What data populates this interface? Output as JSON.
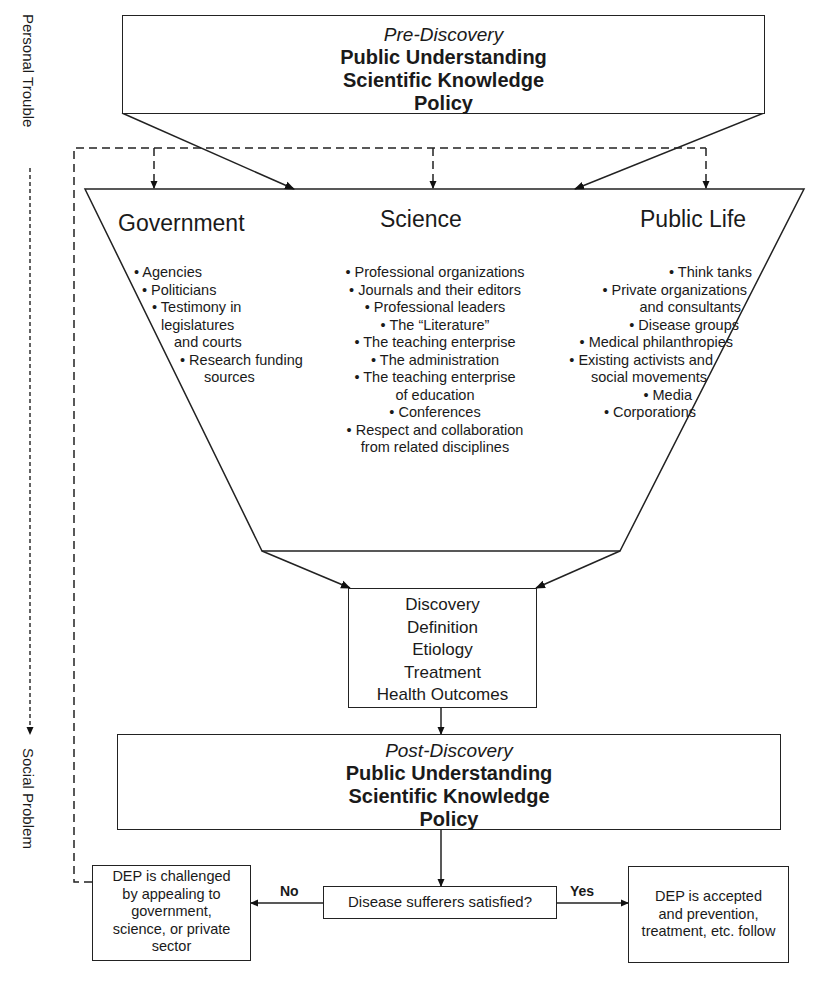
{
  "side_axis": {
    "top_label": "Personal Trouble",
    "bottom_label": "Social Problem"
  },
  "pre_discovery": {
    "title": "Pre-Discovery",
    "lines": [
      "Public Understanding",
      "Scientific Knowledge",
      "Policy"
    ]
  },
  "funnel": {
    "columns": [
      {
        "heading": "Government",
        "items": [
          "• Agencies",
          "• Politicians",
          "• Testimony in",
          "legislatures",
          "and courts",
          "• Research funding",
          "sources"
        ]
      },
      {
        "heading": "Science",
        "items": [
          "• Professional organizations",
          "• Journals and their editors",
          "• Professional leaders",
          "• The “Literature”",
          "• The teaching enterprise",
          "• The administration",
          "• The teaching enterprise",
          "of education",
          "• Conferences",
          "• Respect and collaboration",
          "from related disciplines"
        ]
      },
      {
        "heading": "Public Life",
        "items": [
          "• Think tanks",
          "• Private organizations",
          "and consultants",
          "• Disease groups",
          "• Medical philanthropies",
          "• Existing activists and",
          "social movements",
          "• Media",
          "• Corporations"
        ]
      }
    ]
  },
  "discovery_box": {
    "items": [
      "Discovery",
      "Definition",
      "Etiology",
      "Treatment",
      "Health Outcomes"
    ]
  },
  "post_discovery": {
    "title": "Post-Discovery",
    "lines": [
      "Public Understanding",
      "Scientific Knowledge",
      "Policy"
    ]
  },
  "decision": {
    "question": "Disease sufferers satisfied?",
    "no_label": "No",
    "yes_label": "Yes",
    "no_outcome": [
      "DEP is challenged",
      "by appealing to",
      "government,",
      "science, or private",
      "sector"
    ],
    "yes_outcome": [
      "DEP is accepted",
      "and prevention,",
      "treatment, etc. follow"
    ]
  }
}
